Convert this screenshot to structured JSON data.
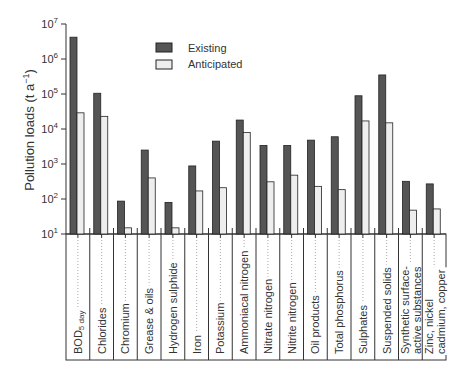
{
  "chart_data": {
    "type": "bar",
    "title": "",
    "xlabel": "",
    "ylabel": "Pollution loads (t a⁻¹)",
    "yscale": "log",
    "ylim": [
      10,
      10000000
    ],
    "yticks": [
      "10^1",
      "10^2",
      "10^3",
      "10^4",
      "10^5",
      "10^6",
      "10^7"
    ],
    "grid": false,
    "legend_position": "upper-center",
    "categories": [
      "BOD5 day",
      "Chlorides",
      "Chromium",
      "Grease & oils",
      "Hydrogen sulphide",
      "Iron",
      "Potassium",
      "Ammoniacal nitrogen",
      "Nitrate nitrogen",
      "Nitrite nitrogen",
      "Oil products",
      "Total phosphorus",
      "Sulphates",
      "Suspended solids",
      "Synthetic surface-active substances",
      "Zinc, nickel cadmium, copper"
    ],
    "series": [
      {
        "name": "Existing",
        "color": "#555555",
        "values": [
          4200000,
          105000,
          87,
          2500,
          80,
          880,
          4500,
          18000,
          3400,
          3400,
          4800,
          6000,
          89000,
          350000,
          320,
          270
        ]
      },
      {
        "name": "Anticipated",
        "color": "#eeeeee",
        "values": [
          29000,
          23000,
          15,
          400,
          15,
          170,
          210,
          8000,
          310,
          480,
          230,
          185,
          17000,
          15000,
          48,
          52
        ]
      }
    ]
  },
  "legend": {
    "existing": "Existing",
    "anticipated": "Anticipated"
  },
  "axis": {
    "ylabel": "Pollution loads  (t a",
    "ylabel_sup": "−1",
    "ylabel_end": ")"
  },
  "labels": [
    {
      "l1": "BOD",
      "sub": "5 day"
    },
    {
      "l1": "Chlorides"
    },
    {
      "l1": "Chromium"
    },
    {
      "l1": "Grease & oils"
    },
    {
      "l1": "Hydrogen sulphide"
    },
    {
      "l1": "Iron"
    },
    {
      "l1": "Potassium"
    },
    {
      "l1": "Ammoniacal nitrogen"
    },
    {
      "l1": "Nitrate nitrogen"
    },
    {
      "l1": "Nitrite nitrogen"
    },
    {
      "l1": "Oil products"
    },
    {
      "l1": "Total phosphorus"
    },
    {
      "l1": "Sulphates"
    },
    {
      "l1": "Suspended solids"
    },
    {
      "l1": "Synthetic surface-",
      "l2": "active substances"
    },
    {
      "l1": "Zinc, nickel",
      "l2": "cadmium, copper"
    }
  ]
}
